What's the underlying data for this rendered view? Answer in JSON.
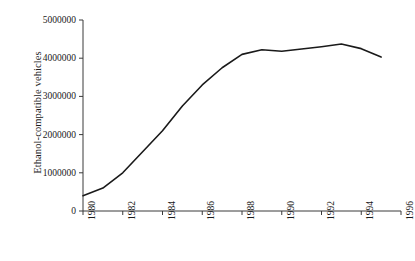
{
  "chart_data": {
    "type": "line",
    "title": "",
    "xlabel": "",
    "ylabel": "Ethanol-compatible vehicles",
    "xlim": [
      1980,
      1996
    ],
    "ylim": [
      0,
      5000000
    ],
    "grid": false,
    "legend": null,
    "line_color": "#1a1a1a",
    "x": [
      1980,
      1981,
      1982,
      1983,
      1984,
      1985,
      1986,
      1987,
      1988,
      1989,
      1990,
      1991,
      1992,
      1993,
      1994,
      1995
    ],
    "values": [
      400000,
      600000,
      1000000,
      1550000,
      2100000,
      2750000,
      3300000,
      3750000,
      4100000,
      4220000,
      4180000,
      4240000,
      4300000,
      4370000,
      4250000,
      4030000
    ],
    "series": [
      {
        "name": "Ethanol-compatible vehicles",
        "values": [
          400000,
          600000,
          1000000,
          1550000,
          2100000,
          2750000,
          3300000,
          3750000,
          4100000,
          4220000,
          4180000,
          4240000,
          4300000,
          4370000,
          4250000,
          4030000
        ]
      }
    ],
    "x_ticks": [
      1980,
      1982,
      1984,
      1986,
      1988,
      1990,
      1992,
      1994,
      1996
    ],
    "x_tick_labels": [
      "1980",
      "1982",
      "1984",
      "1986",
      "1988",
      "1990",
      "1992",
      "1994",
      "1996"
    ],
    "y_ticks": [
      0,
      1000000,
      2000000,
      3000000,
      4000000,
      5000000
    ],
    "y_tick_labels": [
      "0",
      "1000000",
      "2000000",
      "3000000",
      "4000000",
      "5000000"
    ]
  }
}
